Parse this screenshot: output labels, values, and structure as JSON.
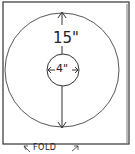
{
  "diagram": {
    "type": "pattern-template",
    "outer_circle": {
      "label": "15\"",
      "diameter_in": 15
    },
    "inner_circle": {
      "label": "4\"",
      "diameter_in": 4
    },
    "fold_label": "FOLD",
    "stroke_color": "#333333",
    "background": "#ffffff"
  }
}
